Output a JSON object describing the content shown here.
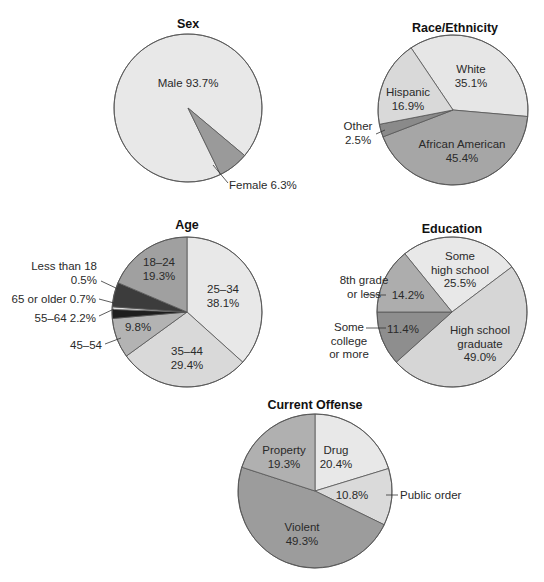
{
  "chart_data": [
    {
      "type": "pie",
      "title": "Sex",
      "center": [
        188,
        108
      ],
      "radius": 74,
      "slices": [
        {
          "label": "Male",
          "value": 93.7,
          "color": "#e8e8e8",
          "start": 154,
          "end": 490
        },
        {
          "label": "Female",
          "value": 6.3,
          "color": "#9a9a9a",
          "start": 130,
          "end": 154
        }
      ],
      "labels": [
        {
          "lines": [
            "Male 93.7%"
          ],
          "x": 188,
          "y": 87,
          "anchor": "middle"
        },
        {
          "lines": [
            "Female 6.3%"
          ],
          "x": 229,
          "y": 189,
          "anchor": "start",
          "leader": [
            [
              213,
              165
            ],
            [
              228,
              183
            ]
          ]
        }
      ]
    },
    {
      "type": "pie",
      "title": "Race/Ethnicity",
      "center": [
        453,
        110
      ],
      "radius": 75,
      "slices": [
        {
          "label": "White",
          "value": 35.1,
          "color": "#e6e6e6",
          "start": 326,
          "end": 455
        },
        {
          "label": "African American",
          "value": 45.4,
          "color": "#a6a6a6",
          "start": 95,
          "end": 249
        },
        {
          "label": "Other",
          "value": 2.5,
          "color": "#8a8a8a",
          "start": 249,
          "end": 259
        },
        {
          "label": "Hispanic",
          "value": 16.9,
          "color": "#d9d9d9",
          "start": 259,
          "end": 326
        }
      ],
      "labels": [
        {
          "lines": [
            "White",
            "35.1%"
          ],
          "x": 471,
          "y": 73,
          "anchor": "middle"
        },
        {
          "lines": [
            "Hispanic",
            "16.9%"
          ],
          "x": 408,
          "y": 96,
          "anchor": "middle"
        },
        {
          "lines": [
            "Other",
            "2.5%"
          ],
          "x": 358,
          "y": 130,
          "anchor": "middle",
          "leader": [
            [
              376,
              134
            ],
            [
              385,
              130
            ]
          ]
        },
        {
          "lines": [
            "African American",
            "45.4%"
          ],
          "x": 462,
          "y": 148,
          "anchor": "middle"
        }
      ]
    },
    {
      "type": "pie",
      "title": "Age",
      "center": [
        187,
        312
      ],
      "radius": 75,
      "slices": [
        {
          "label": "25–34",
          "value": 38.1,
          "color": "#e8e8e8",
          "start": 0,
          "end": 132
        },
        {
          "label": "35–44",
          "value": 29.4,
          "color": "#d9d9d9",
          "start": 132,
          "end": 234
        },
        {
          "label": "45–54",
          "value": 9.8,
          "color": "#b3b3b3",
          "start": 234,
          "end": 265
        },
        {
          "label": "55–64",
          "value": 2.2,
          "color": "#1e1e1e",
          "start": 265,
          "end": 272
        },
        {
          "label": "65 or older",
          "value": 0.7,
          "color": "#e0e0e0",
          "start": 272,
          "end": 274
        },
        {
          "label": "Less than 18",
          "value": 0.5,
          "color": "#3c3c3c",
          "start": 274,
          "end": 293
        },
        {
          "label": "18–24",
          "value": 19.3,
          "color": "#a0a0a0",
          "start": 293,
          "end": 360
        }
      ],
      "labels": [
        {
          "lines": [
            "18–24",
            "19.3%"
          ],
          "x": 159,
          "y": 266,
          "anchor": "middle"
        },
        {
          "lines": [
            "25–34",
            "38.1%"
          ],
          "x": 223,
          "y": 293,
          "anchor": "middle"
        },
        {
          "lines": [
            "35–44",
            "29.4%"
          ],
          "x": 187,
          "y": 355,
          "anchor": "middle"
        },
        {
          "lines": [
            "9.8%"
          ],
          "x": 138,
          "y": 331,
          "anchor": "middle"
        },
        {
          "lines": [
            "Less than 18",
            "0.5%"
          ],
          "x": 97,
          "y": 270,
          "anchor": "end",
          "leader": [
            [
              101,
              281
            ],
            [
              118,
              289
            ]
          ]
        },
        {
          "lines": [
            "65 or older 0.7%"
          ],
          "x": 96,
          "y": 303,
          "anchor": "end",
          "leader": [
            [
              99,
              299
            ],
            [
              114,
              303
            ]
          ]
        },
        {
          "lines": [
            "55–64 2.2%"
          ],
          "x": 96,
          "y": 322,
          "anchor": "end",
          "leader": [
            [
              99,
              316
            ],
            [
              114,
              309
            ]
          ]
        },
        {
          "lines": [
            "45–54"
          ],
          "x": 102,
          "y": 349,
          "anchor": "end",
          "leader": [
            [
              105,
              344
            ],
            [
              121,
              338
            ]
          ]
        }
      ]
    },
    {
      "type": "pie",
      "title": "Education",
      "center": [
        452,
        312
      ],
      "radius": 75,
      "slices": [
        {
          "label": "Some high school",
          "value": 25.5,
          "color": "#e8e8e8",
          "start": 321,
          "end": 413
        },
        {
          "label": "High school graduate",
          "value": 49.0,
          "color": "#d6d6d6",
          "start": 53,
          "end": 228
        },
        {
          "label": "Some college or more",
          "value": 11.4,
          "color": "#8e8e8e",
          "start": 228,
          "end": 270
        },
        {
          "label": "8th grade or less",
          "value": 14.2,
          "color": "#adadad",
          "start": 270,
          "end": 321
        }
      ],
      "labels": [
        {
          "lines": [
            "Some",
            "high school",
            "25.5%"
          ],
          "x": 460,
          "y": 260,
          "anchor": "middle"
        },
        {
          "lines": [
            "High school",
            "graduate",
            "49.0%"
          ],
          "x": 480,
          "y": 334,
          "anchor": "middle"
        },
        {
          "lines": [
            "14.2%"
          ],
          "x": 408,
          "y": 299,
          "anchor": "middle"
        },
        {
          "lines": [
            "11.4%"
          ],
          "x": 403,
          "y": 333,
          "anchor": "middle"
        },
        {
          "lines": [
            "8th grade",
            "or less"
          ],
          "x": 364,
          "y": 284,
          "anchor": "middle",
          "leader": [
            [
              366,
              295
            ],
            [
              386,
              295
            ]
          ]
        },
        {
          "lines": [
            "Some",
            "college",
            "or more"
          ],
          "x": 349,
          "y": 331,
          "anchor": "middle",
          "leader": [
            [
              366,
              328
            ],
            [
              386,
              328
            ]
          ]
        }
      ]
    },
    {
      "type": "pie",
      "title": "Current Offense",
      "center": [
        315,
        491
      ],
      "radius": 77,
      "slices": [
        {
          "label": "Drug",
          "value": 20.4,
          "color": "#e8e8e8",
          "start": 0,
          "end": 73
        },
        {
          "label": "Public order",
          "value": 10.8,
          "color": "#dadada",
          "start": 73,
          "end": 116
        },
        {
          "label": "Violent",
          "value": 49.3,
          "color": "#9c9c9c",
          "start": 116,
          "end": 288
        },
        {
          "label": "Property",
          "value": 19.3,
          "color": "#b0b0b0",
          "start": 288,
          "end": 360
        }
      ],
      "labels": [
        {
          "lines": [
            "Property",
            "19.3%"
          ],
          "x": 284,
          "y": 454,
          "anchor": "middle"
        },
        {
          "lines": [
            "Drug",
            "20.4%"
          ],
          "x": 336,
          "y": 454,
          "anchor": "middle"
        },
        {
          "lines": [
            "10.8%"
          ],
          "x": 352,
          "y": 499,
          "anchor": "middle"
        },
        {
          "lines": [
            "Violent",
            "49.3%"
          ],
          "x": 302,
          "y": 531,
          "anchor": "middle"
        },
        {
          "lines": [
            "Public order"
          ],
          "x": 400,
          "y": 499,
          "anchor": "start",
          "leader": [
            [
              386,
              495
            ],
            [
              398,
              495
            ]
          ]
        }
      ]
    }
  ],
  "titles": {
    "sex": "Sex",
    "race": "Race/Ethnicity",
    "age": "Age",
    "education": "Education",
    "offense": "Current Offense"
  },
  "title_positions": {
    "sex": [
      188,
      28
    ],
    "race": [
      455,
      32
    ],
    "age": [
      187,
      229
    ],
    "education": [
      452,
      233
    ],
    "offense": [
      315,
      409
    ]
  }
}
